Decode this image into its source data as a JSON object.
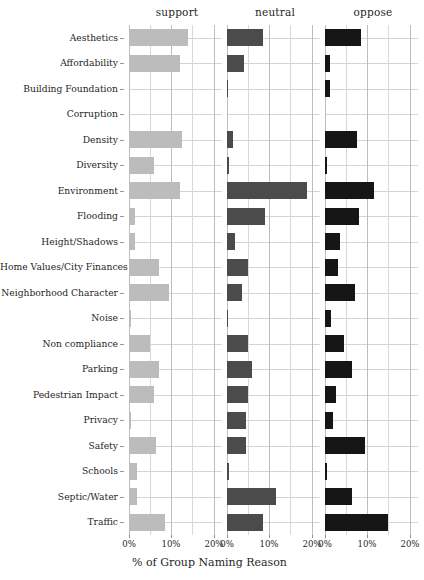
{
  "chart_data": {
    "type": "bar",
    "title": "",
    "subtitle": "",
    "xlabel": "% of Group Naming Reason",
    "ylabel": "",
    "orientation": "horizontal",
    "facet_by": "group",
    "xlim": [
      0,
      22
    ],
    "xticks": [
      0,
      10,
      20
    ],
    "xtick_labels": [
      "0%",
      "10%",
      "20%"
    ],
    "grid": true,
    "legend_position": "none",
    "categories": [
      "Aesthetics",
      "Affordability",
      "Building Foundation",
      "Corruption",
      "Density",
      "Diversity",
      "Environment",
      "Flooding",
      "Height/Shadows",
      "Home Values/City Finances",
      "Neighborhood Character",
      "Noise",
      "Non compliance",
      "Parking",
      "Pedestrian Impact",
      "Privacy",
      "Safety",
      "Schools",
      "Septic/Water",
      "Traffic"
    ],
    "series": [
      {
        "name": "support",
        "color": "#bcbcbc",
        "values": [
          14.0,
          12.0,
          0.3,
          0.0,
          12.5,
          6.0,
          12.0,
          1.5,
          1.5,
          7.0,
          9.5,
          0.4,
          5.0,
          7.0,
          6.0,
          0.4,
          6.5,
          2.0,
          2.0,
          8.5
        ]
      },
      {
        "name": "neutral",
        "color": "#4b4b4b",
        "values": [
          8.5,
          4.0,
          0.2,
          0.0,
          1.5,
          0.4,
          19.0,
          9.0,
          2.0,
          5.0,
          3.5,
          0.2,
          5.0,
          6.0,
          5.0,
          4.5,
          4.5,
          0.4,
          11.5,
          8.5
        ]
      },
      {
        "name": "oppose",
        "color": "#161616",
        "values": [
          8.5,
          1.2,
          1.2,
          0.0,
          7.5,
          0.4,
          11.5,
          8.0,
          3.5,
          3.0,
          7.0,
          1.5,
          4.5,
          6.5,
          2.5,
          1.8,
          9.5,
          0.5,
          6.5,
          15.0
        ]
      }
    ],
    "panel_titles": [
      "support",
      "neutral",
      "oppose"
    ]
  }
}
